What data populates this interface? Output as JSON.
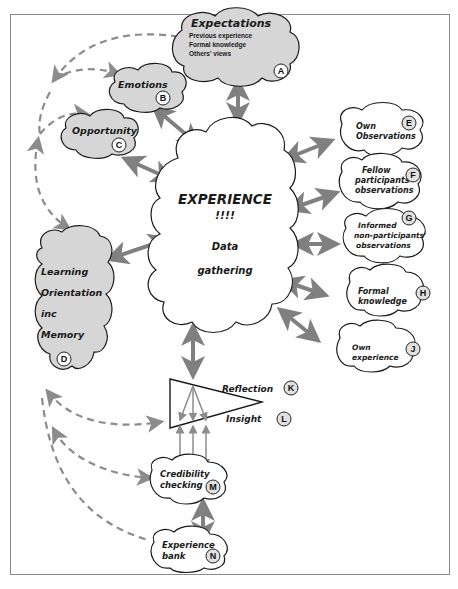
{
  "diagram": {
    "center": {
      "title": "EXPERIENCE",
      "exclaim": "!!!!",
      "line1": "Data",
      "line2": "gathering"
    },
    "nodes": {
      "A": {
        "badge": "A",
        "title": "Expectations",
        "lines": [
          "Previous experience",
          "Formal knowledge",
          "Others' views"
        ],
        "style": "grey"
      },
      "B": {
        "badge": "B",
        "title": "Emotions",
        "style": "grey"
      },
      "C": {
        "badge": "C",
        "title": "Opportunity",
        "style": "grey"
      },
      "D": {
        "badge": "D",
        "lines": [
          "Learning",
          "Orientation",
          "inc",
          "Memory"
        ],
        "style": "grey"
      },
      "E": {
        "badge": "E",
        "lines": [
          "Own",
          "Observations"
        ],
        "style": "white"
      },
      "F": {
        "badge": "F",
        "lines": [
          "Fellow",
          "participants",
          "observations"
        ],
        "style": "white"
      },
      "G": {
        "badge": "G",
        "lines": [
          "Informed",
          "non-participants'",
          "observations"
        ],
        "style": "white"
      },
      "H": {
        "badge": "H",
        "lines": [
          "Formal",
          "knowledge"
        ],
        "style": "white"
      },
      "J": {
        "badge": "J",
        "lines": [
          "Own",
          "experience"
        ],
        "style": "white"
      },
      "K": {
        "badge": "K",
        "title": "Reflection"
      },
      "L": {
        "badge": "L",
        "title": "Insight"
      },
      "M": {
        "badge": "M",
        "lines": [
          "Credibility",
          "checking"
        ],
        "style": "white"
      },
      "N": {
        "badge": "N",
        "lines": [
          "Experience",
          "bank"
        ],
        "style": "white"
      }
    },
    "colors": {
      "grey_cloud": "#d6d6d6",
      "badge_fill": "#e0e0e0",
      "arrow": "#808080",
      "outline": "#1a1a1a"
    }
  }
}
